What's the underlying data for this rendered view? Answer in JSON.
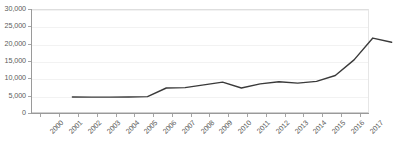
{
  "chart_data": {
    "type": "line",
    "title": "",
    "subtitle": "",
    "xlabel": "",
    "ylabel": "",
    "grid": true,
    "legend": false,
    "legend_position": "none",
    "line_color": "#3a3a3a",
    "gridline_color": "#f2f2f2",
    "axis_color": "#9a9a9a",
    "tick_label_color": "#5b5b5b",
    "x_tick_rotation": -45,
    "categories": [
      "2000",
      "2001",
      "2002",
      "2003",
      "2004",
      "2005",
      "2006",
      "2007",
      "2008",
      "2009",
      "2010",
      "2011",
      "2012",
      "2013",
      "2014",
      "2015",
      "2016",
      "2017"
    ],
    "values": [
      7500,
      7450,
      7450,
      7500,
      7600,
      10100,
      10200,
      11000,
      11800,
      10100,
      11300,
      11900,
      11500,
      12000,
      13700,
      18200,
      24500,
      23300
    ],
    "ylim": [
      0,
      30000
    ],
    "ytick_values": [
      0,
      5000,
      10000,
      15000,
      20000,
      25000,
      30000
    ],
    "ytick_labels": [
      "0",
      "5,000",
      "10,000",
      "15,000",
      "20,000",
      "25,000",
      "30,000"
    ],
    "series": [
      {
        "name": "",
        "values": [
          7500,
          7450,
          7450,
          7500,
          7600,
          10100,
          10200,
          11000,
          11800,
          10100,
          11300,
          11900,
          11500,
          12000,
          13700,
          18200,
          24500,
          23300
        ]
      }
    ]
  }
}
